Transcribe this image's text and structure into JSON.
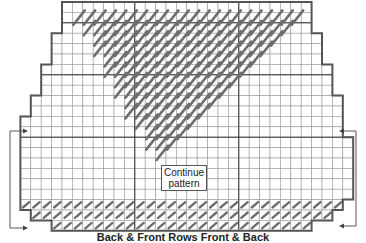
{
  "diagram": {
    "type": "knitting-chart",
    "label": "Continue pattern",
    "label_lines": [
      "Continue",
      "pattern"
    ],
    "caption": "Back & Front   Rows   Front & Back",
    "colors": {
      "grid": "#9a9a9a",
      "grid_major": "#333333",
      "outline": "#555555",
      "stitch": "#6e6e6e",
      "arrow": "#444444"
    }
  },
  "grid": {
    "origin_x": 10,
    "origin_y": 2,
    "cell": 10.4,
    "cols": 33,
    "rows": 22,
    "major_cols": [
      12,
      22
    ],
    "major_rows": [
      2,
      7,
      13
    ]
  },
  "shape": {
    "steps": [
      {
        "row_start": 0,
        "row_end": 2,
        "col_start": 5,
        "col_end": 29
      },
      {
        "row_start": 2,
        "row_end": 3,
        "col_start": 5,
        "col_end": 29
      },
      {
        "row_start": 3,
        "row_end": 6,
        "col_start": 4,
        "col_end": 30
      },
      {
        "row_start": 6,
        "row_end": 9,
        "col_start": 3,
        "col_end": 31
      },
      {
        "row_start": 9,
        "row_end": 11,
        "col_start": 2,
        "col_end": 32
      },
      {
        "row_start": 11,
        "row_end": 13,
        "col_start": 1,
        "col_end": 32
      },
      {
        "row_start": 13,
        "row_end": 19,
        "col_start": 1,
        "col_end": 33
      },
      {
        "row_start": 19,
        "row_end": 20,
        "col_start": 1,
        "col_end": 32
      },
      {
        "row_start": 20,
        "row_end": 21,
        "col_start": 2,
        "col_end": 31
      },
      {
        "row_start": 21,
        "row_end": 22,
        "col_start": 4,
        "col_end": 29
      }
    ]
  },
  "stitches": {
    "top_triangle": {
      "row_start": 1,
      "row_end": 15,
      "left_top": 6,
      "right_top": 28,
      "shrink_left": 0.55,
      "shrink_right": 1.0
    },
    "bottom_band_rows": [
      19,
      20,
      21
    ]
  },
  "arrows": {
    "left": {
      "x": 10,
      "from_y": 228,
      "to_y": 131,
      "tip_x": 23
    },
    "right": {
      "x": 356,
      "from_y": 226,
      "to_y": 131,
      "tip_x": 344
    }
  }
}
